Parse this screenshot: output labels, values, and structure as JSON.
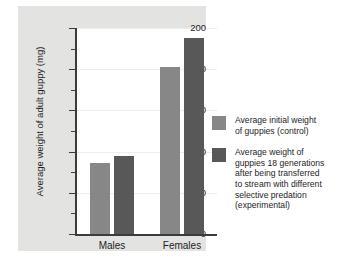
{
  "chart_data": {
    "type": "bar",
    "title": "",
    "xlabel": "",
    "ylabel": "Average weight of adult guppy (mg)",
    "categories": [
      "Males",
      "Females"
    ],
    "series": [
      {
        "name": "Average initial weight of guppies (control)",
        "color": "#878787",
        "values": [
          69,
          162
        ]
      },
      {
        "name": "Average weight of guppies 18 generations after being transferred to stream with different selective predation (experimental)",
        "color": "#585858",
        "values": [
          76,
          190
        ]
      }
    ],
    "ylim": [
      0,
      200
    ],
    "yticks": [
      0,
      40,
      80,
      120,
      160,
      200
    ],
    "ytick_labels": [
      "0",
      "40",
      "80",
      "120",
      "160",
      "200"
    ],
    "yminor_ticks": [
      20,
      60,
      100,
      140,
      180
    ],
    "grid": true,
    "grid_axis": "y",
    "legend_position": "right"
  },
  "legend": {
    "entries": [
      {
        "lines": [
          "Average initial weight",
          "of guppies (control)"
        ],
        "color": "#878787"
      },
      {
        "lines": [
          "Average weight of",
          "guppies 18 generations",
          "after being transferred",
          "to stream with different",
          "selective predation",
          "(experimental)"
        ],
        "color": "#585858"
      }
    ]
  },
  "colors": {
    "panel_background": "#e3e3e1",
    "plot_background": "#ffffff",
    "axis": "#3b3b3b",
    "gridline": "#ededea",
    "text": "#1d1d1d",
    "series_control": "#878787",
    "series_experimental": "#585858"
  }
}
